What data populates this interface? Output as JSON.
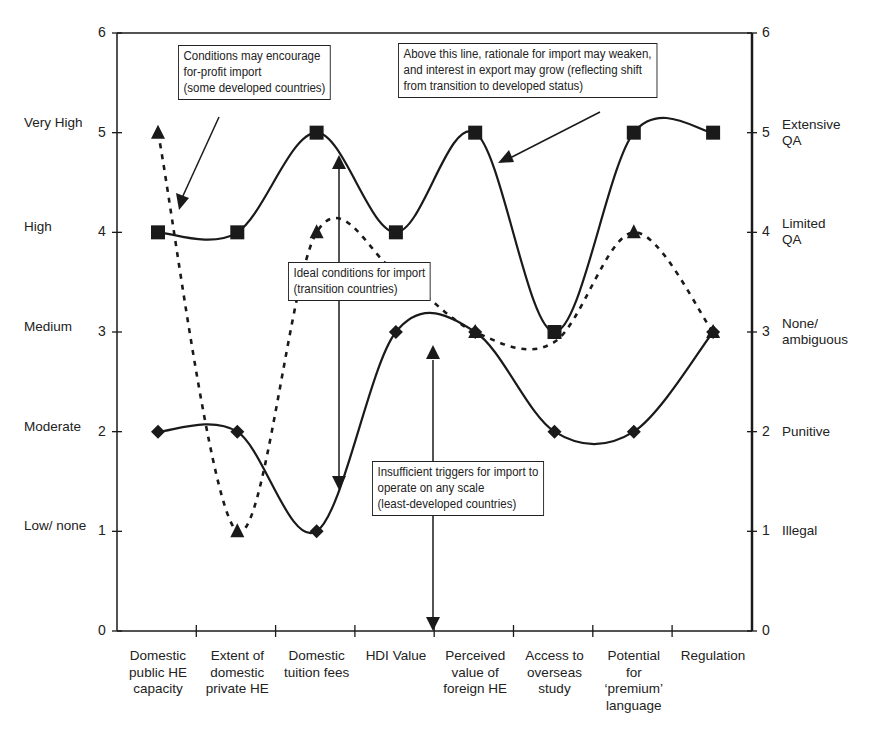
{
  "chart_data": {
    "type": "line",
    "title": "",
    "xlabel": "",
    "ylabel": "",
    "ylim": [
      0,
      6
    ],
    "y2lim": [
      0,
      6
    ],
    "grid": false,
    "legend": null,
    "categories": [
      "Domestic public HE capacity",
      "Extent of domestic private HE",
      "Domestic tuition fees",
      "HDI Value",
      "Perceived value of foreign HE",
      "Access to overseas study",
      "Potential for 'premium' language",
      "Regulation"
    ],
    "category_lines": [
      [
        "Domestic",
        "public HE",
        "capacity"
      ],
      [
        "Extent of",
        "domestic",
        "private HE"
      ],
      [
        "Domestic",
        "tuition fees"
      ],
      [
        "HDI Value"
      ],
      [
        "Perceived",
        "value of",
        "foreign HE"
      ],
      [
        "Access to",
        "overseas",
        "study"
      ],
      [
        "Potential",
        "for",
        "‘premium’",
        "language"
      ],
      [
        "Regulation"
      ]
    ],
    "series": [
      {
        "name": "Developed countries (squares, solid)",
        "marker": "square",
        "line": "solid",
        "values": [
          4,
          4,
          5,
          4,
          5,
          3,
          5,
          5
        ]
      },
      {
        "name": "Transition countries (triangles, dashed)",
        "marker": "triangle",
        "line": "dashed",
        "values": [
          5,
          1,
          4,
          null,
          3,
          null,
          4,
          3
        ],
        "curve_through": [
          5,
          1,
          4,
          3.6,
          3,
          2.9,
          4,
          3
        ]
      },
      {
        "name": "Least-developed countries (diamonds, solid)",
        "marker": "diamond",
        "line": "solid",
        "values": [
          2,
          2,
          1,
          3,
          3,
          2,
          2,
          3
        ]
      }
    ],
    "left_axis": {
      "ticks": [
        "0",
        "1",
        "2",
        "3",
        "4",
        "5",
        "6"
      ],
      "labels": [
        {
          "value": 5.1,
          "text": "Very High"
        },
        {
          "value": 4.05,
          "text": "High"
        },
        {
          "value": 3.05,
          "text": "Medium"
        },
        {
          "value": 2.05,
          "text": "Moderate"
        },
        {
          "value": 1.05,
          "text": "Low/ none"
        }
      ]
    },
    "right_axis": {
      "ticks": [
        "0",
        "1",
        "2",
        "3",
        "4",
        "5",
        "6"
      ],
      "labels": [
        {
          "value": 5,
          "lines": [
            "Extensive",
            "QA"
          ]
        },
        {
          "value": 4,
          "lines": [
            "Limited",
            "QA"
          ]
        },
        {
          "value": 3,
          "lines": [
            "None/",
            "ambiguous"
          ]
        },
        {
          "value": 2,
          "lines": [
            "Punitive"
          ]
        },
        {
          "value": 1,
          "lines": [
            "Illegal"
          ]
        }
      ]
    },
    "annotations": [
      {
        "id": "for-profit",
        "lines": [
          "Conditions may encourage",
          "for-profit import",
          "(some developed countries)"
        ]
      },
      {
        "id": "above-line",
        "lines": [
          "Above this line, rationale for import may weaken,",
          "and interest in export may grow (reflecting shift",
          "from transition to developed status)"
        ]
      },
      {
        "id": "ideal",
        "lines": [
          "Ideal conditions for import",
          "(transition countries)"
        ]
      },
      {
        "id": "insufficient",
        "lines": [
          "Insufficient triggers for import to",
          "operate on any scale",
          "(least-developed countries)"
        ]
      }
    ]
  },
  "colors": {
    "ink": "#1a1a1a",
    "background": "#ffffff"
  }
}
